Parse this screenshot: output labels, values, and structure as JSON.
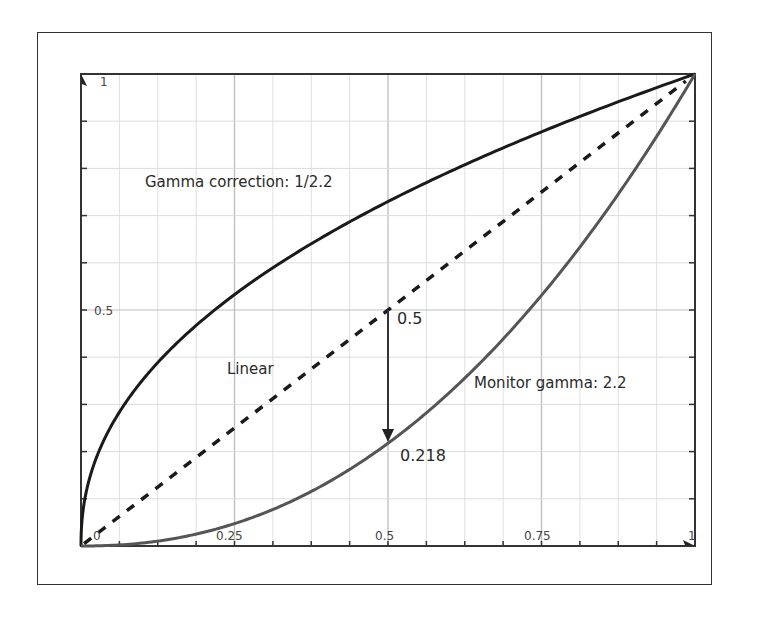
{
  "chart_data": {
    "type": "line",
    "title": "",
    "xlabel": "",
    "ylabel": "",
    "xlim": [
      0,
      1
    ],
    "ylim": [
      0,
      1
    ],
    "grid": true,
    "x_ticks": [
      {
        "value": 0,
        "label": "0"
      },
      {
        "value": 0.25,
        "label": "0.25"
      },
      {
        "value": 0.5,
        "label": "0.5"
      },
      {
        "value": 0.75,
        "label": "0.75"
      },
      {
        "value": 1,
        "label": "1"
      }
    ],
    "y_ticks": [
      {
        "value": 0.5,
        "label": "0.5"
      },
      {
        "value": 1,
        "label": "1"
      }
    ],
    "series": [
      {
        "name": "Gamma correction: 1/2.2",
        "gamma": 0.4545,
        "style": "solid",
        "color": "#1a1a1a",
        "label_pos": [
          0.2,
          0.82
        ]
      },
      {
        "name": "Linear",
        "gamma": 1.0,
        "style": "dashed",
        "color": "#1a1a1a",
        "label_pos": [
          0.46,
          0.37
        ]
      },
      {
        "name": "Monitor gamma: 2.2",
        "gamma": 2.2,
        "style": "solid",
        "color": "#555555",
        "label_pos": [
          0.63,
          0.35
        ]
      }
    ],
    "annotations": [
      {
        "text": "0.5",
        "x": 0.5,
        "y": 0.5
      },
      {
        "text": "0.218",
        "x": 0.5,
        "y": 0.218
      },
      {
        "type": "arrow",
        "from": [
          0.5,
          0.5
        ],
        "to": [
          0.5,
          0.218
        ]
      }
    ]
  },
  "labels": {
    "gamma_correction": "Gamma correction: 1/2.2",
    "linear": "Linear",
    "monitor_gamma": "Monitor gamma: 2.2",
    "annot_05": "0.5",
    "annot_0218": "0.218",
    "x0": "0",
    "x025": "0.25",
    "x05": "0.5",
    "x075": "0.75",
    "x1": "1",
    "y05": "0.5",
    "y1": "1"
  }
}
